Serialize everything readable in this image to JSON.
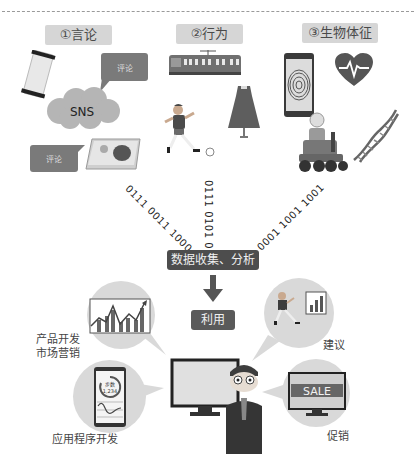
{
  "categories": [
    {
      "label": "①言论"
    },
    {
      "label": "②行为"
    },
    {
      "label": "③生物体征"
    }
  ],
  "speech": {
    "comment_top": "评论",
    "comment_bottom": "评论",
    "sns": "SNS"
  },
  "binary": {
    "left": "0111 0011 1000",
    "middle": "0111 0101 0101",
    "right": "0001 1001 1001"
  },
  "flow": {
    "collect": "数据收集、分析",
    "use": "利用"
  },
  "uses": {
    "product": [
      "产品开发",
      "市场营销"
    ],
    "app": "应用程序开发",
    "advice": "建议",
    "promo": "促销"
  },
  "phone_app": {
    "steps_label": "步数",
    "steps_value": "1,234"
  },
  "sale_screen": {
    "text": "SALE"
  },
  "colors": {
    "label_bg": "#d6d6d6",
    "dark_box": "#4d4d4d",
    "bubble": "#d9d9d9",
    "accent_dark": "#5a5a5a"
  }
}
